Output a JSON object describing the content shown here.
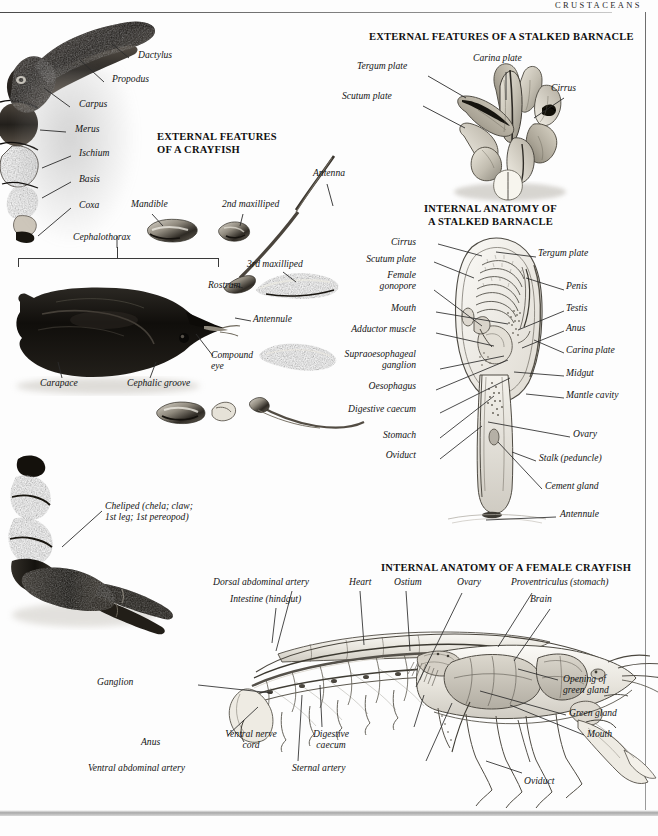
{
  "page": {
    "header": "CRUSTACEANS",
    "background": "#fdfdfd",
    "ink": "#141414"
  },
  "headings": {
    "crayfish_external": [
      "EXTERNAL FEATURES",
      "OF A CRAYFISH"
    ],
    "barnacle_external": "EXTERNAL FEATURES OF A STALKED BARNACLE",
    "barnacle_internal": [
      "INTERNAL ANATOMY OF",
      "A STALKED BARNACLE"
    ],
    "crayfish_internal": "INTERNAL ANATOMY OF A FEMALE CRAYFISH"
  },
  "figures": {
    "crayfish_claw_photo": {
      "caption": null,
      "labels": [
        {
          "text": "Dactylus",
          "x": 138,
          "y": 55
        },
        {
          "text": "Propodus",
          "x": 112,
          "y": 79
        },
        {
          "text": "Carpus",
          "x": 79,
          "y": 103
        },
        {
          "text": "Merus",
          "x": 75,
          "y": 128
        },
        {
          "text": "Ischium",
          "x": 80,
          "y": 152
        },
        {
          "text": "Basis",
          "x": 80,
          "y": 178
        },
        {
          "text": "Coxa",
          "x": 80,
          "y": 204
        }
      ]
    },
    "crayfish_parts_photo": {
      "labels": [
        {
          "text": "Mandible",
          "x": 131,
          "y": 203
        },
        {
          "text": "2nd maxilliped",
          "x": 222,
          "y": 203
        },
        {
          "text": "Antenna",
          "x": 313,
          "y": 172
        },
        {
          "text": "3rd maxilliped",
          "x": 247,
          "y": 263
        },
        {
          "text": "Cephalothorax",
          "x": 73,
          "y": 236
        },
        {
          "text": "Rostrum",
          "x": 208,
          "y": 284
        },
        {
          "text": "Antennule",
          "x": 253,
          "y": 318
        },
        {
          "text": "Compound",
          "x": 211,
          "y": 355
        },
        {
          "text": "eye",
          "x": 211,
          "y": 366
        },
        {
          "text": "Carapace",
          "x": 40,
          "y": 382
        },
        {
          "text": "Cephalic groove",
          "x": 127,
          "y": 382
        }
      ]
    },
    "cheliped_photo": {
      "labels": [
        {
          "text": "Cheliped (chela; claw;",
          "x": 105,
          "y": 505
        },
        {
          "text": "1st leg; 1st pereopod)",
          "x": 105,
          "y": 517
        }
      ]
    },
    "barnacle_external_photo": {
      "labels": [
        {
          "text": "Carina plate",
          "x": 473,
          "y": 57
        },
        {
          "text": "Tergum plate",
          "x": 357,
          "y": 65
        },
        {
          "text": "Scutum plate",
          "x": 342,
          "y": 95
        },
        {
          "text": "Cirrus",
          "x": 551,
          "y": 87
        }
      ]
    },
    "barnacle_internal_art": {
      "labels_left": [
        {
          "text": "Cirrus",
          "x": 408,
          "y": 241
        },
        {
          "text": "Scutum plate",
          "x": 360,
          "y": 258
        },
        {
          "text": "Female",
          "x": 384,
          "y": 274
        },
        {
          "text": "gonopore",
          "x": 377,
          "y": 285
        },
        {
          "text": "Mouth",
          "x": 382,
          "y": 307
        },
        {
          "text": "Adductor muscle",
          "x": 332,
          "y": 328
        },
        {
          "text": "Supraoesophageal",
          "x": 327,
          "y": 353
        },
        {
          "text": "ganglion",
          "x": 374,
          "y": 364
        },
        {
          "text": "Oesophagus",
          "x": 359,
          "y": 385
        },
        {
          "text": "Digestive caecum",
          "x": 341,
          "y": 408
        },
        {
          "text": "Stomach",
          "x": 397,
          "y": 434
        },
        {
          "text": "Oviduct",
          "x": 412,
          "y": 454
        }
      ],
      "labels_right": [
        {
          "text": "Tergum plate",
          "x": 538,
          "y": 252
        },
        {
          "text": "Penis",
          "x": 566,
          "y": 285
        },
        {
          "text": "Testis",
          "x": 566,
          "y": 307
        },
        {
          "text": "Anus",
          "x": 566,
          "y": 327
        },
        {
          "text": "Carina plate",
          "x": 566,
          "y": 349
        },
        {
          "text": "Midgut",
          "x": 566,
          "y": 372
        },
        {
          "text": "Mantle cavity",
          "x": 566,
          "y": 394
        },
        {
          "text": "Ovary",
          "x": 573,
          "y": 433
        },
        {
          "text": "Stalk (peduncle)",
          "x": 539,
          "y": 457
        },
        {
          "text": "Cement gland",
          "x": 545,
          "y": 485
        },
        {
          "text": "Antennule",
          "x": 560,
          "y": 513
        }
      ]
    },
    "crayfish_internal_art": {
      "labels_top": [
        {
          "text": "Dorsal abdominal artery",
          "x": 213,
          "y": 581
        },
        {
          "text": "Intestine (hindgut)",
          "x": 230,
          "y": 598
        },
        {
          "text": "Heart",
          "x": 349,
          "y": 581
        },
        {
          "text": "Ostium",
          "x": 394,
          "y": 581
        },
        {
          "text": "Ovary",
          "x": 457,
          "y": 581
        },
        {
          "text": "Proventriculus (stomach)",
          "x": 511,
          "y": 581
        },
        {
          "text": "Brain",
          "x": 530,
          "y": 598
        }
      ],
      "labels_right": [
        {
          "text": "Opening of",
          "x": 563,
          "y": 678
        },
        {
          "text": "green gland",
          "x": 563,
          "y": 690
        },
        {
          "text": "Green gland",
          "x": 569,
          "y": 712
        },
        {
          "text": "Mouth",
          "x": 587,
          "y": 733
        },
        {
          "text": "Oviduct",
          "x": 524,
          "y": 780
        }
      ],
      "labels_bottom": [
        {
          "text": "Ganglion",
          "x": 97,
          "y": 681
        },
        {
          "text": "Anus",
          "x": 141,
          "y": 741
        },
        {
          "text": "Ventral nerve",
          "x": 227,
          "y": 733
        },
        {
          "text": "cord",
          "x": 245,
          "y": 745
        },
        {
          "text": "Digestive",
          "x": 317,
          "y": 733
        },
        {
          "text": "caecum",
          "x": 322,
          "y": 745
        },
        {
          "text": "Ventral abdominal  artery",
          "x": 88,
          "y": 767
        },
        {
          "text": "Sternal artery",
          "x": 292,
          "y": 767
        }
      ]
    }
  }
}
